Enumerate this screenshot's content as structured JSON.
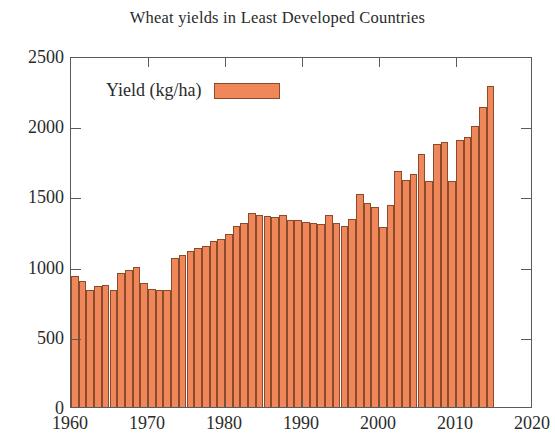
{
  "chart_data": {
    "type": "bar",
    "title": "Wheat yields in Least Developed Countries",
    "xlabel": "",
    "ylabel": "",
    "ylim": [
      0,
      2500
    ],
    "xlim": [
      1960,
      2020
    ],
    "ytick_labels": [
      "0",
      "500",
      "1000",
      "1500",
      "2000",
      "2500"
    ],
    "ytick_values": [
      0,
      500,
      1000,
      1500,
      2000,
      2500
    ],
    "xtick_labels": [
      "1960",
      "1970",
      "1980",
      "1990",
      "2000",
      "2010",
      "2020"
    ],
    "xtick_values": [
      1960,
      1970,
      1980,
      1990,
      2000,
      2010,
      2020
    ],
    "grid": false,
    "legend_position": "top-left-inside",
    "series": [
      {
        "name": "Yield (kg/ha)",
        "color": "#f0875a",
        "edge_color": "#8a4b2a",
        "categories": [
          1960,
          1961,
          1962,
          1963,
          1964,
          1965,
          1966,
          1967,
          1968,
          1969,
          1970,
          1971,
          1972,
          1973,
          1974,
          1975,
          1976,
          1977,
          1978,
          1979,
          1980,
          1981,
          1982,
          1983,
          1984,
          1985,
          1986,
          1987,
          1988,
          1989,
          1990,
          1991,
          1992,
          1993,
          1994,
          1995,
          1996,
          1997,
          1998,
          1999,
          2000,
          2001,
          2002,
          2003,
          2004,
          2005,
          2006,
          2007,
          2008,
          2009,
          2010,
          2011,
          2012,
          2013,
          2014
        ],
        "values": [
          930,
          900,
          830,
          865,
          870,
          835,
          955,
          975,
          1000,
          885,
          840,
          830,
          835,
          1060,
          1085,
          1110,
          1135,
          1145,
          1185,
          1200,
          1235,
          1290,
          1310,
          1385,
          1370,
          1360,
          1355,
          1370,
          1330,
          1330,
          1320,
          1310,
          1305,
          1370,
          1310,
          1290,
          1340,
          1515,
          1450,
          1425,
          1280,
          1440,
          1680,
          1620,
          1660,
          1800,
          1610,
          1870,
          1890,
          1610,
          1900,
          1925,
          2000,
          2140,
          2285
        ]
      }
    ]
  },
  "legend": {
    "label": "Yield (kg/ha)"
  }
}
